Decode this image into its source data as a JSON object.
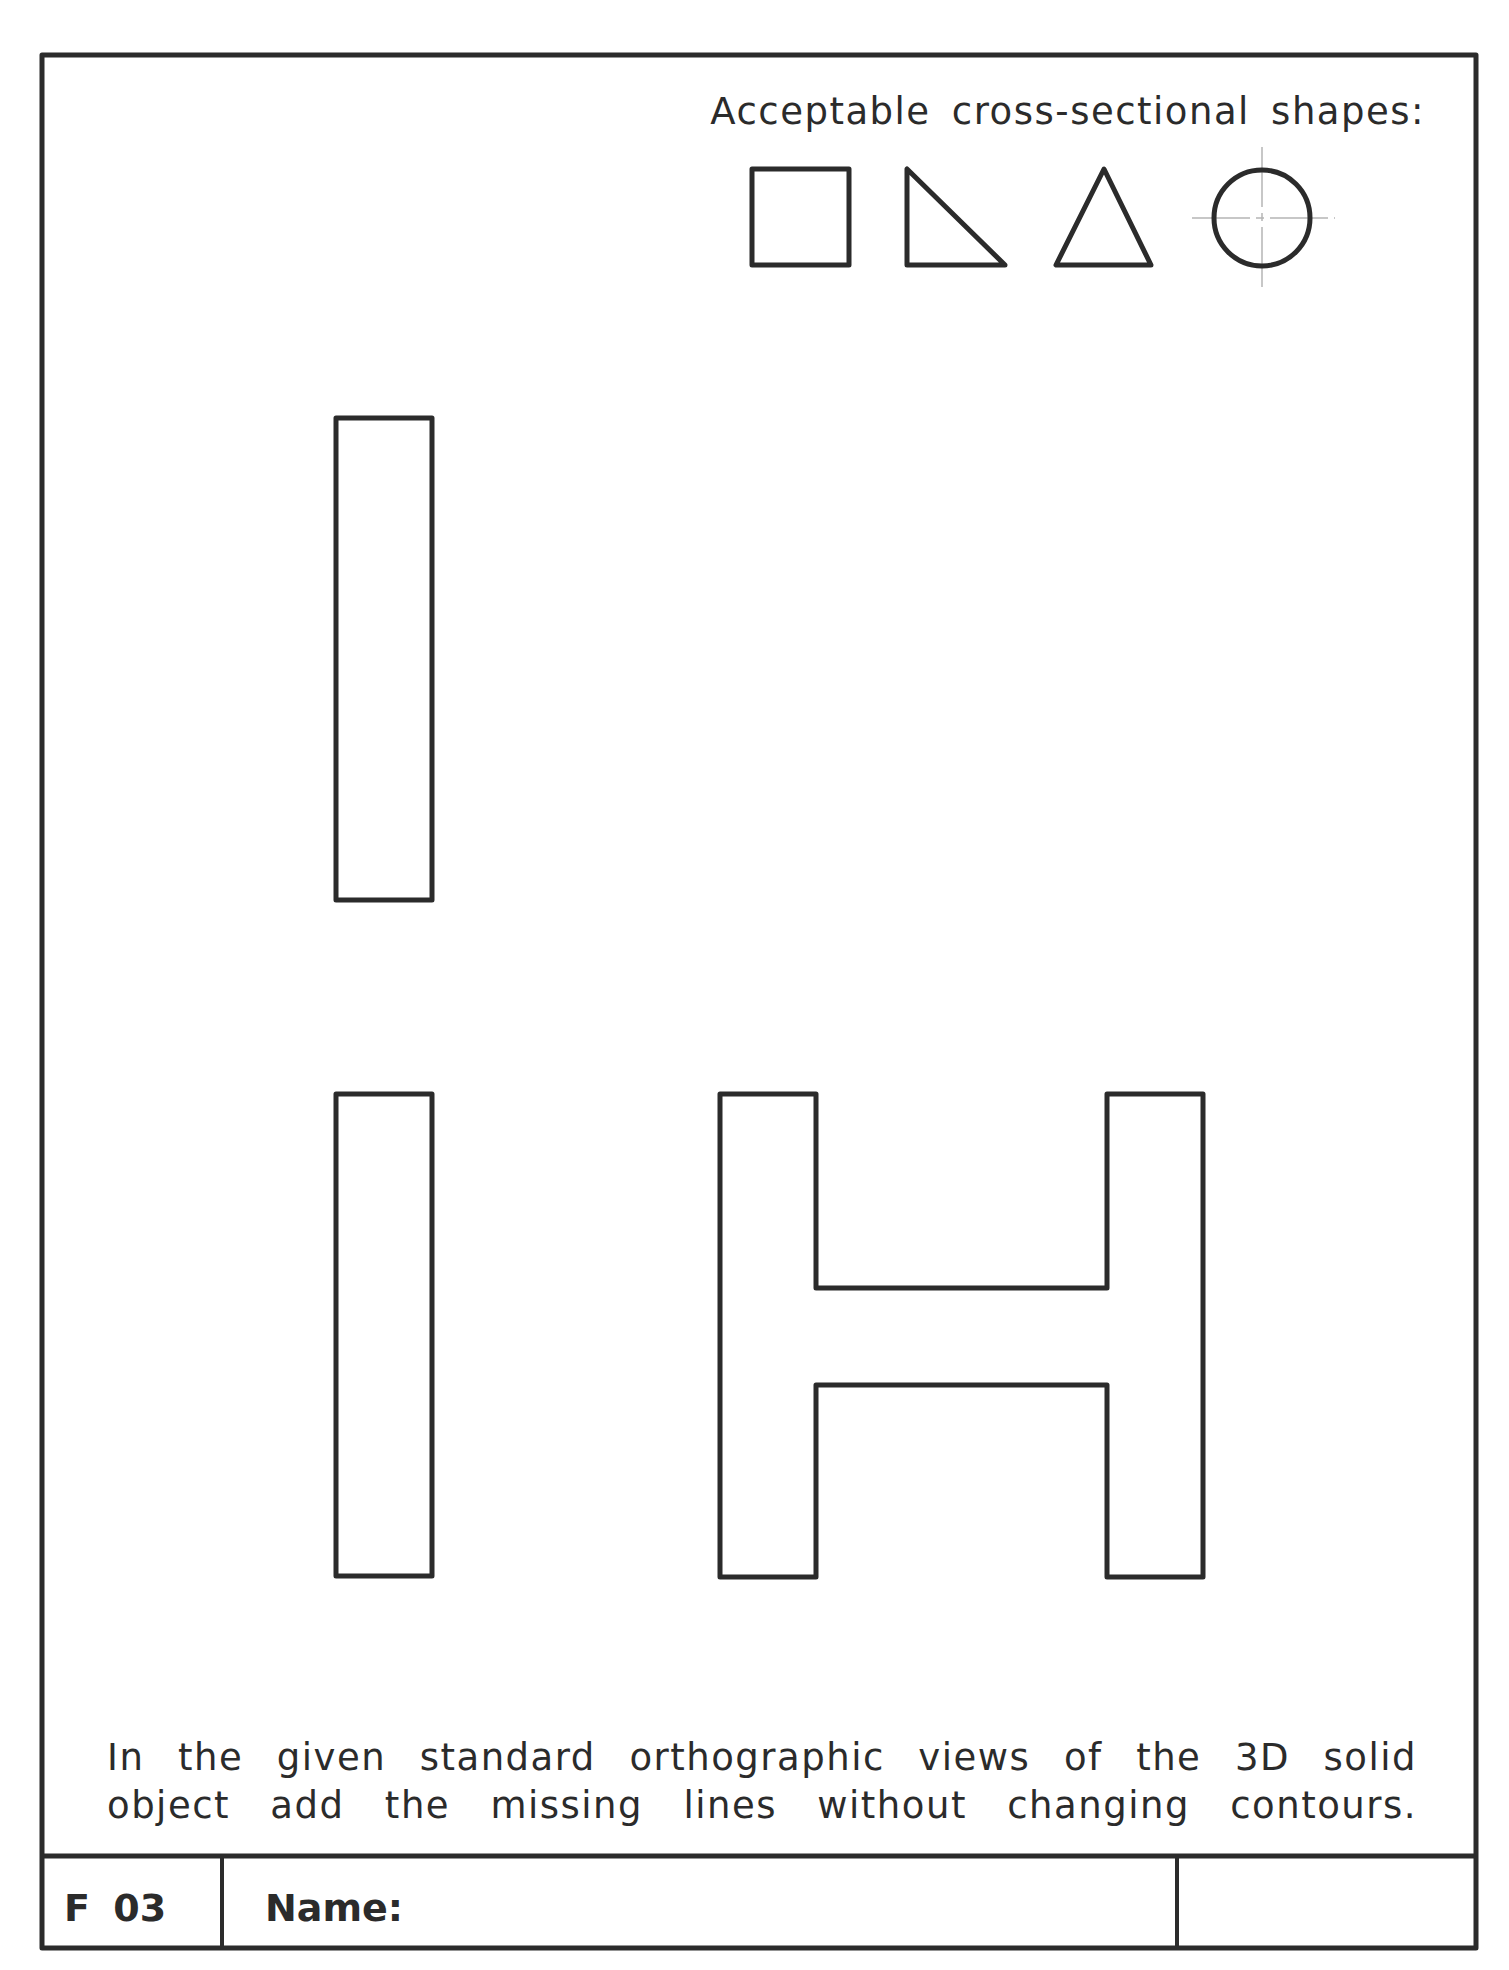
{
  "worksheet": {
    "heading": "Acceptable cross-sectional shapes:",
    "acceptable_shapes": [
      {
        "name": "square",
        "icon": "square-icon"
      },
      {
        "name": "right triangle",
        "icon": "right-triangle-icon"
      },
      {
        "name": "isosceles triangle",
        "icon": "triangle-icon"
      },
      {
        "name": "circle",
        "icon": "circle-icon"
      }
    ],
    "views": [
      {
        "name": "top view",
        "shape": "rectangle"
      },
      {
        "name": "front view",
        "shape": "rectangle"
      },
      {
        "name": "side view",
        "shape": "H-profile"
      }
    ],
    "instruction": {
      "line1": "In the given standard orthographic views of the 3D solid",
      "line2": "object add the missing lines without changing contours."
    },
    "title_block": {
      "code": "F 03",
      "name_label": "Name:",
      "name_value": "",
      "extra_value": ""
    },
    "colors": {
      "line": "#2b2b2b",
      "center_line": "#b5b5b5",
      "paper": "#ffffff"
    }
  }
}
